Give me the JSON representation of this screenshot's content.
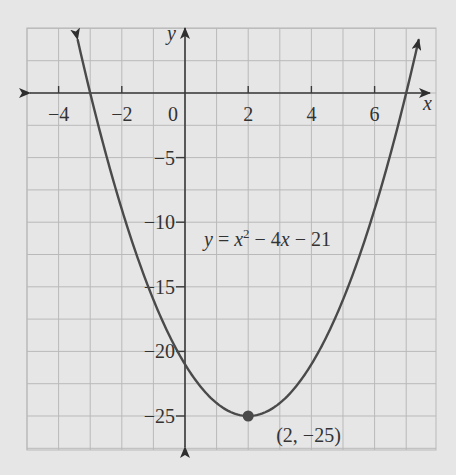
{
  "chart_data": {
    "type": "line",
    "title": "",
    "equation_label": "y = x² − 4x − 21",
    "xlabel": "x",
    "ylabel": "y",
    "xlim": [
      -5,
      8
    ],
    "ylim": [
      -28.5,
      5
    ],
    "grid": true,
    "x_ticks": [
      -4,
      -2,
      0,
      2,
      4,
      6
    ],
    "x_tick_labels": [
      "−4",
      "−2",
      "0",
      "2",
      "4",
      "6"
    ],
    "y_ticks": [
      -5,
      -10,
      -15,
      -20,
      -25
    ],
    "y_tick_labels": [
      "−5",
      "−10",
      "−15",
      "−20",
      "−25"
    ],
    "series": [
      {
        "name": "y = x^2 - 4x - 21",
        "function": {
          "a": 1,
          "b": -4,
          "c": -21
        },
        "x": [
          -3.4,
          -3,
          -2,
          -1,
          0,
          1,
          2,
          3,
          4,
          5,
          6,
          7,
          7.4
        ],
        "y": [
          3.16,
          0,
          -9,
          -16,
          -21,
          -24,
          -25,
          -24,
          -21,
          -16,
          -9,
          0,
          3.16
        ]
      }
    ],
    "annotations": [
      {
        "type": "point",
        "x": 2,
        "y": -25,
        "label": "(2, −25)"
      }
    ],
    "colors": {
      "background": "#e6e6e6",
      "grid": "#b9b9b9",
      "axis": "#3a3a3a",
      "curve": "#4a4a4a",
      "point": "#4a4a4a"
    }
  }
}
